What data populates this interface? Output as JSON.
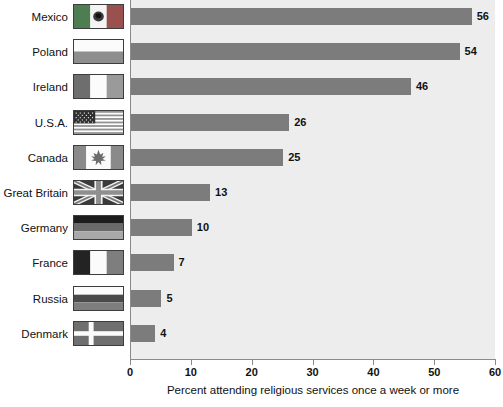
{
  "chart_data": {
    "type": "bar",
    "orientation": "horizontal",
    "title": "",
    "xlabel": "Percent attending religious services once a week or more",
    "ylabel": "",
    "xlim": [
      0,
      60
    ],
    "xticks": [
      0,
      10,
      20,
      30,
      40,
      50,
      60
    ],
    "grid": false,
    "legend": "none",
    "bar_color": "#7c7c7c",
    "plot_background": "#ededed",
    "categories": [
      "Mexico",
      "Poland",
      "Ireland",
      "U.S.A.",
      "Canada",
      "Great Britain",
      "Germany",
      "France",
      "Russia",
      "Denmark"
    ],
    "values": [
      56,
      54,
      46,
      26,
      25,
      13,
      10,
      7,
      5,
      4
    ],
    "value_labels": [
      "56",
      "54",
      "46",
      "26",
      "25",
      "13",
      "10",
      "7",
      "5",
      "4"
    ],
    "tick_labels": [
      "0",
      "10",
      "20",
      "30",
      "40",
      "50",
      "60"
    ]
  },
  "rows": [
    {
      "label": "Mexico",
      "value": 56,
      "value_label": "56",
      "flag": "flag-mexico"
    },
    {
      "label": "Poland",
      "value": 54,
      "value_label": "54",
      "flag": "flag-poland"
    },
    {
      "label": "Ireland",
      "value": 46,
      "value_label": "46",
      "flag": "flag-ireland"
    },
    {
      "label": "U.S.A.",
      "value": 26,
      "value_label": "26",
      "flag": "flag-usa"
    },
    {
      "label": "Canada",
      "value": 25,
      "value_label": "25",
      "flag": "flag-canada"
    },
    {
      "label": "Great Britain",
      "value": 13,
      "value_label": "13",
      "flag": "flag-great-britain"
    },
    {
      "label": "Germany",
      "value": 10,
      "value_label": "10",
      "flag": "flag-germany"
    },
    {
      "label": "France",
      "value": 7,
      "value_label": "7",
      "flag": "flag-france"
    },
    {
      "label": "Russia",
      "value": 5,
      "value_label": "5",
      "flag": "flag-russia"
    },
    {
      "label": "Denmark",
      "value": 4,
      "value_label": "4",
      "flag": "flag-denmark"
    }
  ]
}
